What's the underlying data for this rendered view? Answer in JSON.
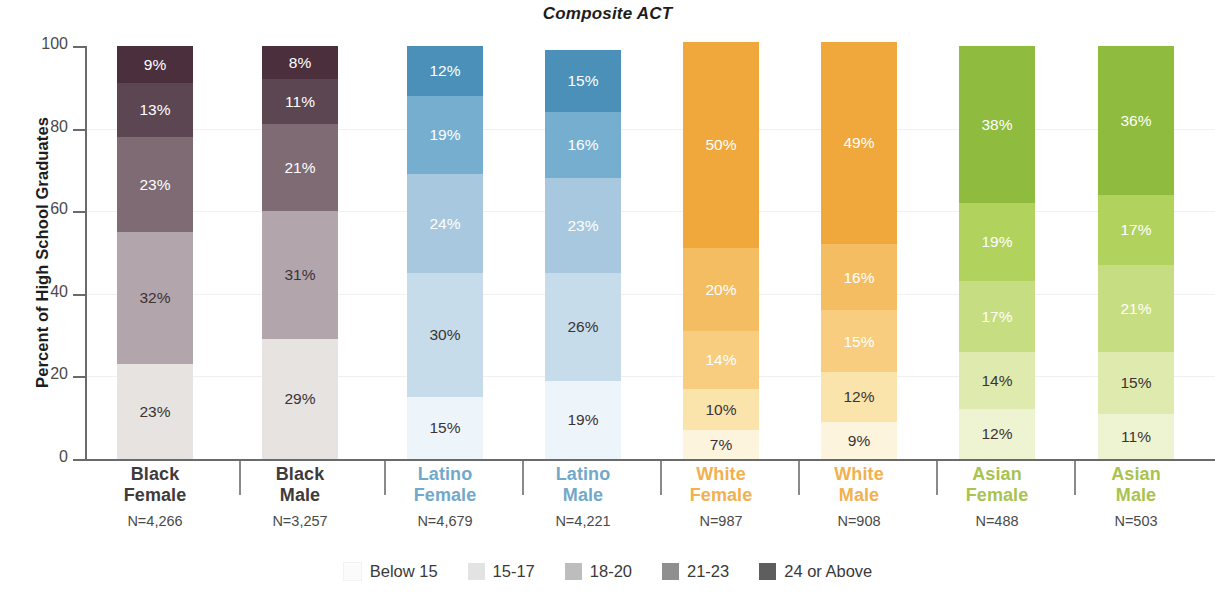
{
  "chart_data": {
    "type": "bar",
    "title": "Composite ACT",
    "subtitle": "",
    "xlabel": "",
    "ylabel": "Percent of High School Graduates",
    "ylim": [
      0,
      100
    ],
    "yticks": [
      0,
      20,
      40,
      60,
      80,
      100
    ],
    "grid": true,
    "stacked": true,
    "stack_order": "bottom-to-top",
    "legend_position": "bottom",
    "legend_entries": [
      "Below 15",
      "15-17",
      "18-20",
      "21-23",
      "24 or Above"
    ],
    "categories": [
      "Black Female",
      "Black Male",
      "Latino Female",
      "Latino Male",
      "White Female",
      "White Male",
      "Asian Female",
      "Asian Male"
    ],
    "category_counts": [
      "N=4,266",
      "N=3,257",
      "N=4,679",
      "N=4,221",
      "N=987",
      "N=908",
      "N=488",
      "N=503"
    ],
    "series": [
      {
        "name": "Below 15",
        "values": [
          23,
          29,
          15,
          19,
          7,
          9,
          12,
          11
        ]
      },
      {
        "name": "15-17",
        "values": [
          32,
          31,
          30,
          26,
          10,
          12,
          14,
          15
        ]
      },
      {
        "name": "18-20",
        "values": [
          23,
          21,
          24,
          23,
          14,
          15,
          17,
          21
        ]
      },
      {
        "name": "21-23",
        "values": [
          13,
          11,
          19,
          16,
          20,
          16,
          19,
          17
        ]
      },
      {
        "name": "24 or Above",
        "values": [
          9,
          8,
          12,
          15,
          50,
          49,
          38,
          36
        ]
      }
    ],
    "data_labels": [
      [
        "23%",
        "32%",
        "23%",
        "13%",
        "9%"
      ],
      [
        "29%",
        "31%",
        "21%",
        "11%",
        "8%"
      ],
      [
        "15%",
        "30%",
        "24%",
        "19%",
        "12%"
      ],
      [
        "19%",
        "26%",
        "23%",
        "16%",
        "15%"
      ],
      [
        "7%",
        "10%",
        "14%",
        "20%",
        "50%"
      ],
      [
        "9%",
        "12%",
        "15%",
        "16%",
        "49%"
      ],
      [
        "12%",
        "14%",
        "17%",
        "19%",
        "38%"
      ],
      [
        "11%",
        "15%",
        "21%",
        "17%",
        "36%"
      ]
    ]
  },
  "title": "Composite ACT",
  "axis": {
    "y_title": "Percent of High School Graduates",
    "y_ticks": [
      "0",
      "20",
      "40",
      "60",
      "80",
      "100"
    ]
  },
  "groups": [
    {
      "id": "black-female",
      "name": "Black\nFemale",
      "n": "N=4,266",
      "label_color": "#3f3a3c",
      "palette": [
        "#e6e3e0",
        "#b3a5ac",
        "#7e6b74",
        "#5c4652",
        "#4c2f3d"
      ],
      "segments": [
        {
          "label": "23%",
          "value": 23,
          "text_color": "#3a3336"
        },
        {
          "label": "32%",
          "value": 32,
          "text_color": "#3a3336"
        },
        {
          "label": "23%",
          "value": 23,
          "text_color": "#ffffff"
        },
        {
          "label": "13%",
          "value": 13,
          "text_color": "#ffffff"
        },
        {
          "label": "9%",
          "value": 9,
          "text_color": "#ffffff"
        }
      ]
    },
    {
      "id": "black-male",
      "name": "Black\nMale",
      "n": "N=3,257",
      "label_color": "#3f3a3c",
      "palette": [
        "#e6e3e0",
        "#b3a5ac",
        "#7e6b74",
        "#5c4652",
        "#4c2f3d"
      ],
      "segments": [
        {
          "label": "29%",
          "value": 29,
          "text_color": "#3a3336"
        },
        {
          "label": "31%",
          "value": 31,
          "text_color": "#3a3336"
        },
        {
          "label": "21%",
          "value": 21,
          "text_color": "#ffffff"
        },
        {
          "label": "11%",
          "value": 11,
          "text_color": "#ffffff"
        },
        {
          "label": "8%",
          "value": 8,
          "text_color": "#ffffff"
        }
      ]
    },
    {
      "id": "latino-female",
      "name": "Latino\nFemale",
      "n": "N=4,679",
      "label_color": "#72a8c9",
      "palette": [
        "#eef5fa",
        "#c6dcea",
        "#a7c8de",
        "#76aed0",
        "#4a90b9"
      ],
      "segments": [
        {
          "label": "15%",
          "value": 15,
          "text_color": "#3a3336"
        },
        {
          "label": "30%",
          "value": 30,
          "text_color": "#3a3336"
        },
        {
          "label": "24%",
          "value": 24,
          "text_color": "#ffffff"
        },
        {
          "label": "19%",
          "value": 19,
          "text_color": "#ffffff"
        },
        {
          "label": "12%",
          "value": 12,
          "text_color": "#ffffff"
        }
      ]
    },
    {
      "id": "latino-male",
      "name": "Latino\nMale",
      "n": "N=4,221",
      "label_color": "#72a8c9",
      "palette": [
        "#eef5fa",
        "#c6dcea",
        "#a7c8de",
        "#76aed0",
        "#4a90b9"
      ],
      "segments": [
        {
          "label": "19%",
          "value": 19,
          "text_color": "#3a3336"
        },
        {
          "label": "26%",
          "value": 26,
          "text_color": "#3a3336"
        },
        {
          "label": "23%",
          "value": 23,
          "text_color": "#ffffff"
        },
        {
          "label": "16%",
          "value": 16,
          "text_color": "#ffffff"
        },
        {
          "label": "15%",
          "value": 15,
          "text_color": "#ffffff"
        }
      ]
    },
    {
      "id": "white-female",
      "name": "White\nFemale",
      "n": "N=987",
      "label_color": "#f2b04e",
      "palette": [
        "#fdf4dd",
        "#fbe3ac",
        "#f8cd7f",
        "#f5bd62",
        "#f0a83c"
      ],
      "segments": [
        {
          "label": "7%",
          "value": 7,
          "text_color": "#3a3336"
        },
        {
          "label": "10%",
          "value": 10,
          "text_color": "#3a3336"
        },
        {
          "label": "14%",
          "value": 14,
          "text_color": "#ffffff"
        },
        {
          "label": "20%",
          "value": 20,
          "text_color": "#ffffff"
        },
        {
          "label": "50%",
          "value": 50,
          "text_color": "#ffffff"
        }
      ]
    },
    {
      "id": "white-male",
      "name": "White\nMale",
      "n": "N=908",
      "label_color": "#f2b04e",
      "palette": [
        "#fdf4dd",
        "#fbe3ac",
        "#f8cd7f",
        "#f5bd62",
        "#f0a83c"
      ],
      "segments": [
        {
          "label": "9%",
          "value": 9,
          "text_color": "#3a3336"
        },
        {
          "label": "12%",
          "value": 12,
          "text_color": "#3a3336"
        },
        {
          "label": "15%",
          "value": 15,
          "text_color": "#ffffff"
        },
        {
          "label": "16%",
          "value": 16,
          "text_color": "#ffffff"
        },
        {
          "label": "49%",
          "value": 49,
          "text_color": "#ffffff"
        }
      ]
    },
    {
      "id": "asian-female",
      "name": "Asian\nFemale",
      "n": "N=488",
      "label_color": "#a9c34e",
      "palette": [
        "#eef3d2",
        "#dfeaae",
        "#c7dd82",
        "#b2d25e",
        "#8fbb3f"
      ],
      "segments": [
        {
          "label": "12%",
          "value": 12,
          "text_color": "#3a3336"
        },
        {
          "label": "14%",
          "value": 14,
          "text_color": "#3a3336"
        },
        {
          "label": "17%",
          "value": 17,
          "text_color": "#ffffff"
        },
        {
          "label": "19%",
          "value": 19,
          "text_color": "#ffffff"
        },
        {
          "label": "38%",
          "value": 38,
          "text_color": "#ffffff"
        }
      ]
    },
    {
      "id": "asian-male",
      "name": "Asian\nMale",
      "n": "N=503",
      "label_color": "#a9c34e",
      "palette": [
        "#eef3d2",
        "#dfeaae",
        "#c7dd82",
        "#b2d25e",
        "#8fbb3f"
      ],
      "segments": [
        {
          "label": "11%",
          "value": 11,
          "text_color": "#3a3336"
        },
        {
          "label": "15%",
          "value": 15,
          "text_color": "#3a3336"
        },
        {
          "label": "21%",
          "value": 21,
          "text_color": "#ffffff"
        },
        {
          "label": "17%",
          "value": 17,
          "text_color": "#ffffff"
        },
        {
          "label": "36%",
          "value": 36,
          "text_color": "#ffffff"
        }
      ]
    }
  ],
  "legend": [
    {
      "label": "Below 15",
      "color": "#fbfbfb"
    },
    {
      "label": "15-17",
      "color": "#e3e3e3"
    },
    {
      "label": "18-20",
      "color": "#bdbdbd"
    },
    {
      "label": "21-23",
      "color": "#8f8f8f"
    },
    {
      "label": "24 or Above",
      "color": "#5e5e5e"
    }
  ]
}
